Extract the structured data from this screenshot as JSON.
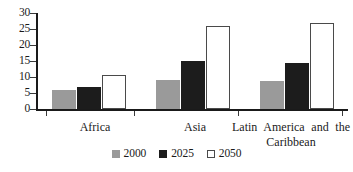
{
  "chart_data": {
    "type": "bar",
    "title": "",
    "subtitle": "",
    "xlabel": "",
    "ylabel": "",
    "ylim": [
      0,
      30
    ],
    "ytick_values": [
      0,
      5,
      10,
      15,
      20,
      25,
      30
    ],
    "ytick_labels": [
      "0",
      "5",
      "10",
      "15",
      "20",
      "25",
      "30"
    ],
    "grid": false,
    "legend_position": "bottom-center",
    "categories": [
      "Africa",
      "Asia",
      "Latin America and the Caribbean"
    ],
    "category_labels": [
      {
        "text": "Africa",
        "lines": [
          "Africa"
        ]
      },
      {
        "text": "Asia",
        "lines": [
          "Asia"
        ]
      },
      {
        "text": "Latin America and the Caribbean",
        "lines": [
          "Latin America and the",
          "Caribbean"
        ]
      }
    ],
    "series": [
      {
        "name": "2000",
        "color": "#9a9a9a",
        "values": [
          5.8,
          9.2,
          8.7
        ]
      },
      {
        "name": "2025",
        "color": "#1c1c1c",
        "values": [
          7.0,
          15.0,
          14.3
        ]
      },
      {
        "name": "2050",
        "color": "#ffffff",
        "values": [
          10.7,
          26.0,
          27.0
        ]
      }
    ],
    "legend": [
      {
        "label": "2000",
        "swatch": "filled-gray"
      },
      {
        "label": "2025",
        "swatch": "filled-black"
      },
      {
        "label": "2050",
        "swatch": "outlined-white"
      }
    ]
  },
  "colors": {
    "series_2000": "#9a9a9a",
    "series_2025": "#1c1c1c",
    "series_2050": "#ffffff",
    "axis": "#1a1a1a",
    "background": "#ffffff"
  }
}
